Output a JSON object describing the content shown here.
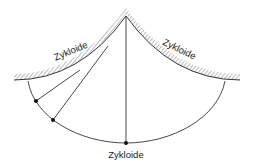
{
  "diagram": {
    "labels": {
      "left_cheek": "Zykloide",
      "right_cheek": "Zykloide",
      "path": "Zykloide"
    },
    "colors": {
      "line": "#333333",
      "hatch": "#777777",
      "dot": "#111111",
      "background": "#ffffff"
    }
  }
}
